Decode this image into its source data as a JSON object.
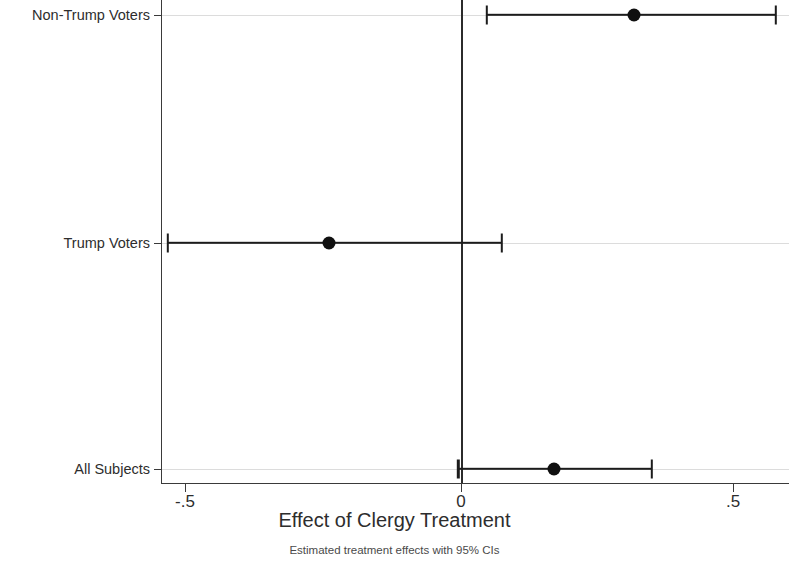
{
  "chart_data": {
    "type": "scatter",
    "title": "",
    "xlabel": "Effect of Clergy Treatment",
    "ylabel": "",
    "note": "Estimated treatment effects with 95% CIs",
    "xlim": [
      -0.585,
      0.555
    ],
    "xticks": [
      -0.5,
      0,
      0.5
    ],
    "xticklabels": [
      "-.5",
      "0",
      ".5"
    ],
    "categories": [
      "Non-Trump Voters",
      "Trump Voters",
      "All Subjects"
    ],
    "grid": "horizontal-category-lines",
    "legend": "none",
    "zero_reference_line": 0,
    "series": [
      {
        "name": "Estimated treatment effect",
        "marker": "filled-circle",
        "color": "#101010",
        "points": [
          {
            "category": "Non-Trump Voters",
            "estimate": 0.315,
            "ci_low": 0.047,
            "ci_high": 0.575
          },
          {
            "category": "Trump Voters",
            "estimate": -0.24,
            "ci_low": -0.535,
            "ci_high": 0.075
          },
          {
            "category": "All Subjects",
            "estimate": 0.17,
            "ci_low": -0.005,
            "ci_high": 0.348
          }
        ]
      }
    ]
  },
  "axis": {
    "x_title": "Effect of Clergy Treatment",
    "note": "Estimated treatment effects with 95% CIs",
    "xticklabels": [
      "-.5",
      "0",
      ".5"
    ],
    "ylabels": [
      "Non-Trump Voters",
      "Trump Voters",
      "All Subjects"
    ]
  },
  "colors": {
    "marker": "#101010",
    "ci": "#1c1c1c",
    "axis": "#3a3a3a",
    "gridline": "#dcdcdc",
    "zero_line": "#2b2b2b",
    "background": "#ffffff"
  }
}
